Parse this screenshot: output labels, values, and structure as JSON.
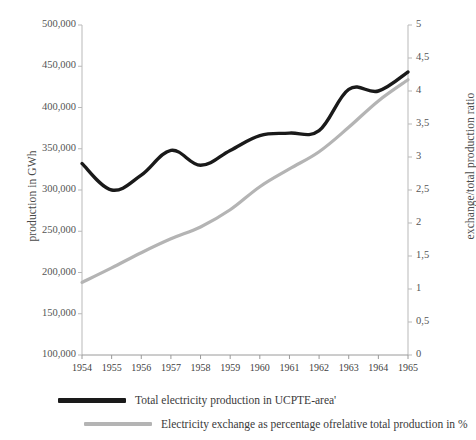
{
  "chart_data": {
    "type": "line",
    "title": "",
    "xlabel": "",
    "ylabel": "production in GWh",
    "y2label": "exchange/total production ratio",
    "grid": false,
    "legend_position": "bottom-left",
    "x": [
      1954,
      1955,
      1956,
      1957,
      1958,
      1959,
      1960,
      1961,
      1962,
      1963,
      1964,
      1965
    ],
    "categories": [
      "1954",
      "1955",
      "1956",
      "1957",
      "1958",
      "1959",
      "1960",
      "1961",
      "1962",
      "1963",
      "1964",
      "1965"
    ],
    "xlim": [
      1954,
      1965
    ],
    "ylim": [
      100000,
      500000
    ],
    "y2lim": [
      0,
      5
    ],
    "yticks": [
      100000,
      150000,
      200000,
      250000,
      300000,
      350000,
      400000,
      450000,
      500000
    ],
    "ytick_labels": [
      "100,000",
      "150,000",
      "200,000",
      "250,000",
      "300,000",
      "350,000",
      "400,000",
      "450,000",
      "500,000"
    ],
    "y2ticks": [
      0,
      0.5,
      1,
      1.5,
      2,
      2.5,
      3,
      3.5,
      4,
      4.5,
      5
    ],
    "y2tick_labels": [
      "0",
      "0,5",
      "1",
      "1,5",
      "2",
      "2,5",
      "3",
      "3,5",
      "4",
      "4,5",
      "5"
    ],
    "series": [
      {
        "name": "Total electricity production in UCPTE-area'",
        "axis": "left",
        "color": "#1a1a1a",
        "width": 3.4,
        "values": [
          332000,
          300000,
          318000,
          348000,
          330000,
          348000,
          366000,
          369000,
          372000,
          422000,
          420000,
          443000
        ]
      },
      {
        "name": "Electricity exchange as percentage ofrelative total production in %",
        "axis": "right",
        "color": "#b4b4b4",
        "width": 3.2,
        "values": [
          1.1,
          1.32,
          1.55,
          1.76,
          1.94,
          2.2,
          2.55,
          2.82,
          3.08,
          3.45,
          3.85,
          4.17
        ]
      }
    ]
  },
  "legend": {
    "items": [
      {
        "label": "Total electricity production in UCPTE-area'",
        "swatch": "black"
      },
      {
        "label": "Electricity exchange as percentage ofrelative total production in %",
        "swatch": "gray"
      }
    ]
  },
  "axes": {
    "left_title": "production in GWh",
    "right_title": "exchange/total production ratio"
  }
}
